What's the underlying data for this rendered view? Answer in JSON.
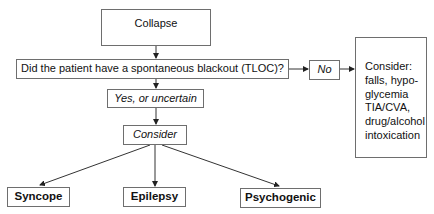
{
  "nodes": {
    "collapse": "Collapse",
    "question": "Did the patient have a spontaneous blackout (TLOC)?",
    "no": "No",
    "alternatives": "Consider:\nfalls, hypo-\nglycemia\nTIA/CVA,\ndrug/alcohol\nintoxication",
    "yes": "Yes, or uncertain",
    "consider": "Consider",
    "syncope": "Syncope",
    "epilepsy": "Epilepsy",
    "psychogenic": "Psychogenic"
  },
  "colors": {
    "line": "#333333",
    "border": "#6e6e6e"
  }
}
